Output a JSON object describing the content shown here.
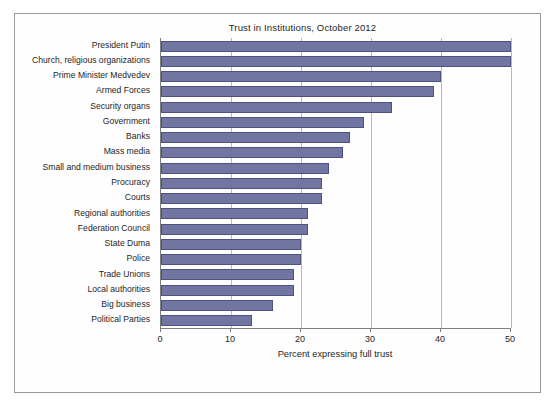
{
  "chart_data": {
    "type": "bar",
    "orientation": "horizontal",
    "title": "Trust in Institutions, October 2012",
    "xlabel": "Percent expressing full trust",
    "ylabel": "",
    "xlim": [
      0,
      52
    ],
    "xticks": [
      0,
      10,
      20,
      30,
      40,
      50
    ],
    "xticklabels": [
      "0",
      "10",
      "20",
      "30",
      "40",
      "50"
    ],
    "grid": "vertical",
    "legend": "none",
    "bar_color": "#7175a1",
    "bar_edge_color": "#4e5280",
    "categories": [
      "President Putin",
      "Church, religious organizations",
      "Prime Minister Medvedev",
      "Armed Forces",
      "Security organs",
      "Government",
      "Banks",
      "Mass media",
      "Small and medium business",
      "Procuracy",
      "Courts",
      "Regional authorities",
      "Federation Council",
      "State Duma",
      "Police",
      "Trade Unions",
      "Local authorities",
      "Big business",
      "Political Parties"
    ],
    "values": [
      51,
      50,
      40,
      39,
      33,
      29,
      27,
      26,
      24,
      23,
      23,
      21,
      21,
      20,
      20,
      19,
      19,
      16,
      13
    ]
  }
}
